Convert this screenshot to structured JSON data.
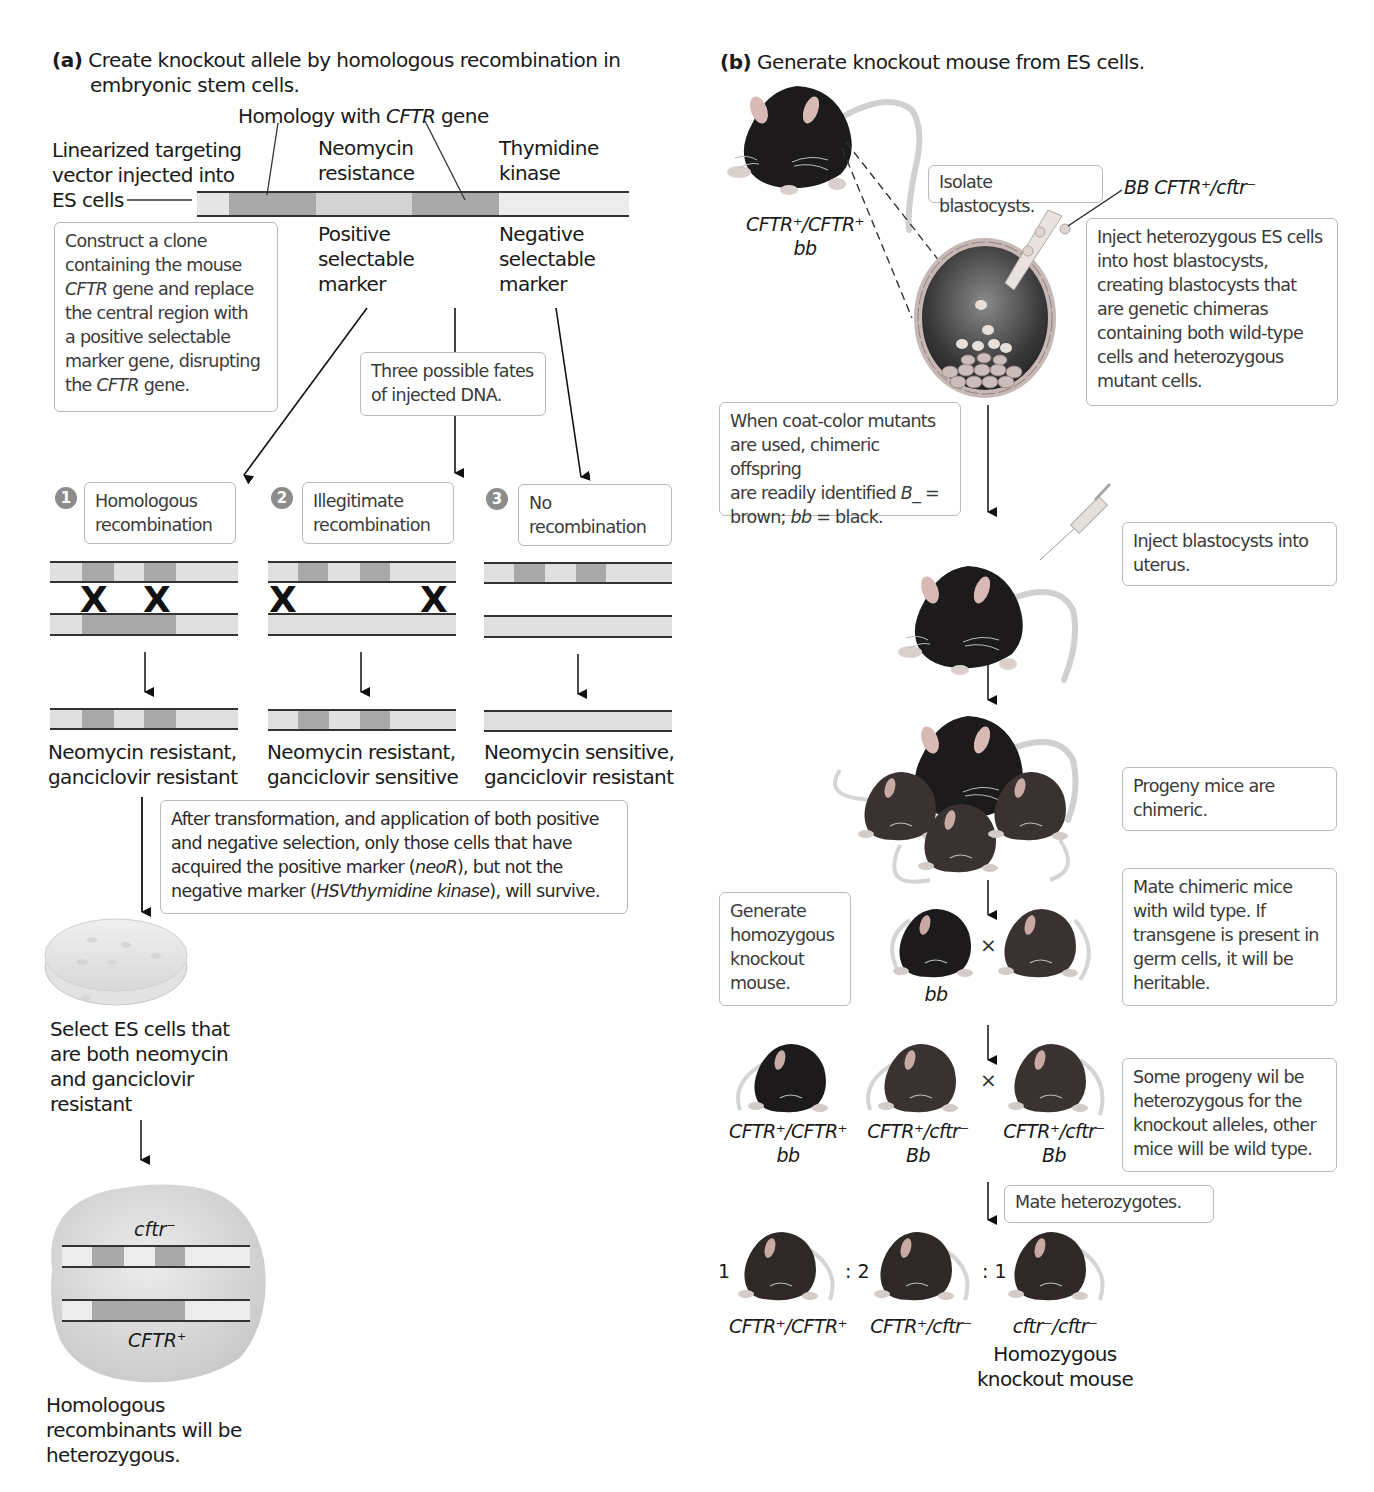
{
  "panel_a": {
    "label": "(a)",
    "title_line1": "Create knockout allele by homologous recombination in",
    "title_line2": "embryonic stem cells.",
    "homology_label_pre": "Homology with ",
    "homology_label_gene": "CFTR",
    "homology_label_post": " gene",
    "vector_label": [
      "Linearized targeting",
      "vector injected into",
      "ES cells"
    ],
    "neo_label": [
      "Neomycin",
      "resistance"
    ],
    "tk_label": [
      "Thymidine",
      "kinase"
    ],
    "positive_label": [
      "Positive",
      "selectable",
      "marker"
    ],
    "negative_label": [
      "Negative",
      "selectable",
      "marker"
    ],
    "construct_box": {
      "line1": "Construct a clone",
      "line2": "containing the mouse",
      "line3_gene": "CFTR",
      "line3_rest": " gene and replace",
      "line4": "the central region with",
      "line5": "a positive selectable",
      "line6": "marker gene, disrupting",
      "line7_pre": "the ",
      "line7_gene": "CFTR",
      "line7_post": " gene."
    },
    "fates_box": [
      "Three possible fates",
      "of injected DNA."
    ],
    "outcomes": [
      {
        "number": "1",
        "title": [
          "Homologous",
          "recombination"
        ],
        "result": [
          "Neomycin resistant,",
          "ganciclovir resistant"
        ]
      },
      {
        "number": "2",
        "title": [
          "Illegitimate",
          "recombination"
        ],
        "result": [
          "Neomycin resistant,",
          "ganciclovir sensitive"
        ]
      },
      {
        "number": "3",
        "title": [
          "No",
          "recombination"
        ],
        "result": [
          "Neomycin sensitive,",
          "ganciclovir resistant"
        ]
      }
    ],
    "selection_box": {
      "line1": "After transformation, and application of both positive",
      "line2": "and negative selection, only those cells that have",
      "line3_pre": "acquired the positive marker (",
      "line3_it": "neoR",
      "line3_post": "), but not the",
      "line4_pre": "negative marker (",
      "line4_it": "HSVthymidine kinase",
      "line4_post": "), will survive."
    },
    "select_label": [
      "Select ES cells that",
      "are both neomycin",
      "and ganciclovir",
      "resistant"
    ],
    "cell_allele_top": "cftr",
    "cell_allele_top_sup": "−",
    "cell_allele_bottom": "CFTR",
    "cell_allele_bottom_sup": "+",
    "final_label": [
      "Homologous",
      "recombinants will be",
      "heterozygous."
    ]
  },
  "panel_b": {
    "label": "(b)",
    "title": "Generate knockout mouse from ES cells.",
    "donor_genotype": "CFTR⁺/CFTR⁺",
    "donor_coat": "bb",
    "isolate_box": "Isolate blastocysts.",
    "es_cells_label": "BB CFTR⁺/cftr⁻",
    "inject_es_box": [
      "Inject heterozygous ES cells",
      "into host blastocysts,",
      "creating blastocysts that",
      "are genetic chimeras",
      "containing both wild-type",
      "cells and heterozygous",
      "mutant cells."
    ],
    "coat_box": {
      "line1": "When coat-color mutants",
      "line2": "are used, chimeric offspring",
      "line3_pre": "are readily identified ",
      "line3_it": "B_",
      "line3_post": " =",
      "line4_it1": "bb",
      "line4_pre": "brown; ",
      "line4_post": " = black."
    },
    "inject_uterus_box": [
      "Inject blastocysts into",
      "uterus."
    ],
    "progeny_box": [
      "Progeny mice are",
      "chimeric."
    ],
    "generate_box": [
      "Generate",
      "homozygous",
      "knockout",
      "mouse."
    ],
    "mate_wild_box": [
      "Mate chimeric mice",
      "with wild type. If",
      "transgene is present in",
      "germ cells, it will be",
      "heritable."
    ],
    "cross_symbol": "×",
    "cross1_left_coat": "bb",
    "f1_mice": [
      {
        "genotype": "CFTR⁺/CFTR⁺",
        "coat": "bb"
      },
      {
        "genotype": "CFTR⁺/cftr⁻",
        "coat": "Bb"
      },
      {
        "genotype": "CFTR⁺/cftr⁻",
        "coat": "Bb"
      }
    ],
    "some_progeny_box": [
      "Some progeny wil be",
      "heterozygous for the",
      "knockout alleles, other",
      "mice will be wild type."
    ],
    "mate_het_box": "Mate heterozygotes.",
    "ratio": [
      "1",
      ": 2",
      ": 1"
    ],
    "f2_mice": [
      {
        "genotype": "CFTR⁺/CFTR⁺"
      },
      {
        "genotype": "CFTR⁺/cftr⁻"
      },
      {
        "genotype": "cftr⁻/cftr⁻",
        "note": [
          "Homozygous",
          "knockout mouse"
        ]
      }
    ]
  },
  "colors": {
    "dna_light": "#dcdcdc",
    "dna_dark": "#a9a9a9",
    "box_border": "#b9b9b9",
    "mouse_black": "#1c1a1a",
    "mouse_brown": "#3a3230",
    "badge": "#8c8c8c"
  }
}
